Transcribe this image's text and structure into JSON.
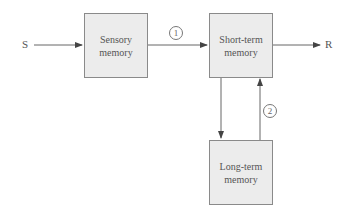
{
  "diagram": {
    "input_label": "S",
    "output_label": "R",
    "boxes": {
      "sensory": {
        "line1": "Sensory",
        "line2": "memory"
      },
      "short_term": {
        "line1": "Short-term",
        "line2": "memory"
      },
      "long_term": {
        "line1": "Long-term",
        "line2": "memory"
      }
    },
    "markers": {
      "one": "1",
      "two": "2"
    },
    "colors": {
      "box_fill": "#ececec",
      "box_border": "#8a8a8a",
      "line": "#666666"
    }
  }
}
